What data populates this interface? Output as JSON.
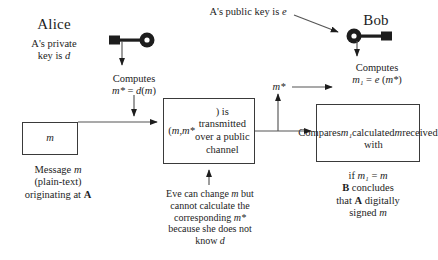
{
  "diagram": {
    "title_alice": "Alice",
    "title_bob": "Bob",
    "alice_key_caption": "A's private\nkey is d",
    "bob_key_caption": "A's public key is e",
    "alice_computes": "Computes\nm* = d(m)",
    "bob_computes": "Computes\nm₁ = e (m*)",
    "message_box": "m",
    "message_caption": "Message m\n(plain-text)\noriginating at A",
    "channel_box": "(m, m*) is\ntransmitted\nover a public\nchannel",
    "eve_note": "Eve can change m but\ncannot calculate the\ncorresponding m*\nbecause she does not\nknow d",
    "compare_box": "Compares m₁\ncalculated with\nm received",
    "conclusion": "if m₁ = m\nB concludes\nthat A digitally\nsigned m",
    "mstar_label": "m*",
    "icons": {
      "alice_key": "key-icon",
      "bob_key": "key-icon"
    },
    "colors": {
      "ink": "#1d1d1d",
      "stroke": "#3a3a3a",
      "background": "#ffffff"
    }
  }
}
